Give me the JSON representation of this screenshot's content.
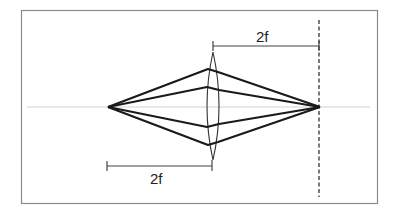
{
  "diagram": {
    "title": "",
    "type": "converging-lens ray diagram",
    "labels": {
      "top_dimension": "2f",
      "bottom_dimension": "2f"
    },
    "colors": {
      "frame": "#8a8a8a",
      "axis": "#cfcfcf",
      "rays": "#1a1a1a",
      "lens": "#333333",
      "dimension_lines": "#444444",
      "image_plane": "#333333"
    },
    "geometry": {
      "frame": {
        "x": 21,
        "y": 10,
        "width": 356,
        "height": 193
      },
      "optical_axis_y": 107,
      "object_point": {
        "x": 108,
        "y": 107
      },
      "image_point": {
        "x": 320,
        "y": 107
      },
      "lens": {
        "center_x": 213,
        "top_y": 52,
        "bottom_y": 160,
        "half_thickness": 6
      },
      "image_plane_x": 319,
      "top_dimension": {
        "x1": 213,
        "x2": 319,
        "y": 46
      },
      "bottom_dimension": {
        "x1": 107,
        "x2": 212,
        "y": 166
      }
    },
    "rays": [
      {
        "name": "ray-upper-outer",
        "entry": [
          208,
          69
        ],
        "exit": [
          218,
          72
        ]
      },
      {
        "name": "ray-upper-inner",
        "entry": [
          207,
          87
        ],
        "exit": [
          219,
          90
        ]
      },
      {
        "name": "ray-lower-inner",
        "entry": [
          207,
          127
        ],
        "exit": [
          219,
          124
        ]
      },
      {
        "name": "ray-lower-outer",
        "entry": [
          208,
          145
        ],
        "exit": [
          218,
          142
        ]
      }
    ]
  }
}
